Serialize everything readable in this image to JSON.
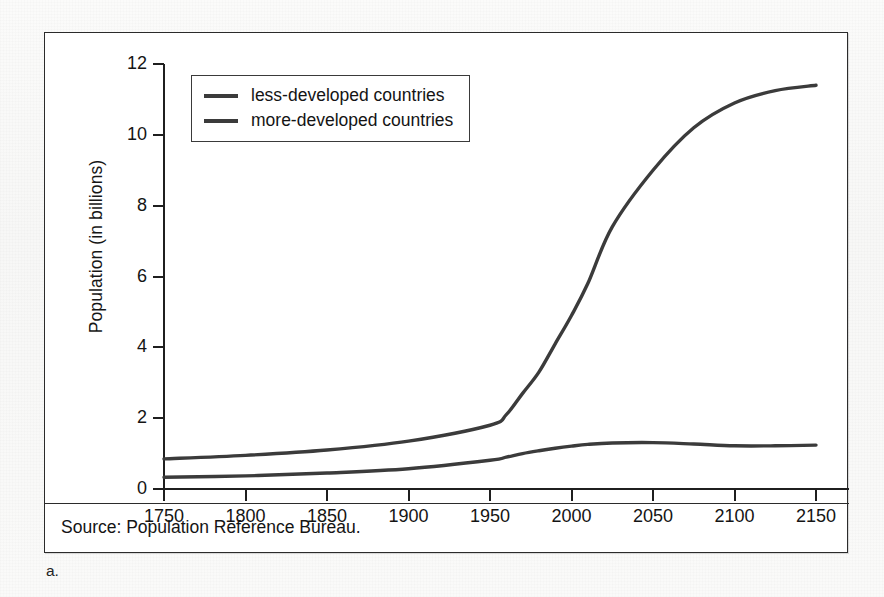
{
  "figure": {
    "caption": "a.",
    "source": "Source: Population Reference Bureau."
  },
  "chart_data": {
    "type": "line",
    "title": "",
    "xlabel": "",
    "ylabel": "Population (in billions)",
    "xlim": [
      1750,
      2150
    ],
    "ylim": [
      0,
      12
    ],
    "xticks": [
      1750,
      1800,
      1850,
      1900,
      1950,
      2000,
      2050,
      2100,
      2150
    ],
    "xtick_labels": [
      "1750",
      "1800",
      "1850",
      "1900",
      "1950",
      "2000",
      "2050",
      "2100",
      "2150"
    ],
    "yticks": [
      0,
      2,
      4,
      6,
      8,
      10,
      12
    ],
    "ytick_labels": [
      "0",
      "2",
      "4",
      "6",
      "8",
      "10",
      "12"
    ],
    "grid": false,
    "legend_position": "upper-left-inside",
    "line_color": "#3b3b3b",
    "x": [
      1750,
      1800,
      1850,
      1900,
      1950,
      1960,
      1970,
      1980,
      1990,
      2000,
      2010,
      2025,
      2050,
      2075,
      2100,
      2125,
      2150
    ],
    "series": [
      {
        "name": "less-developed countries",
        "values": [
          0.85,
          0.95,
          1.1,
          1.35,
          1.8,
          2.1,
          2.7,
          3.3,
          4.1,
          4.9,
          5.8,
          7.4,
          9.0,
          10.2,
          10.9,
          11.25,
          11.4
        ]
      },
      {
        "name": "more-developed countries",
        "values": [
          0.33,
          0.37,
          0.45,
          0.57,
          0.81,
          0.9,
          1.0,
          1.08,
          1.15,
          1.21,
          1.26,
          1.3,
          1.31,
          1.27,
          1.22,
          1.22,
          1.24
        ]
      }
    ]
  },
  "legend": {
    "entries": [
      {
        "label": "less-developed countries"
      },
      {
        "label": "more-developed countries"
      }
    ]
  }
}
